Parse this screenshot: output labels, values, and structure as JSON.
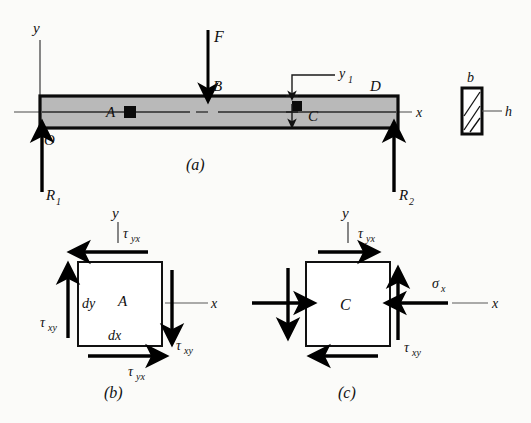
{
  "figure": {
    "panels": [
      {
        "key": "a",
        "caption": "(a)"
      },
      {
        "key": "b",
        "caption": "(b)"
      },
      {
        "key": "c",
        "caption": "(c)"
      }
    ]
  },
  "colors": {
    "beam_fill": "#b9b9b9",
    "beam_stroke": "#0b0b0b",
    "arrow": "#000000",
    "axis": "#3a3a3a",
    "background": "#fbfbf9",
    "element_fill": "#ffffff"
  },
  "panel_a": {
    "caption": "(a)",
    "axis_y_label": "y",
    "axis_x_label": "x",
    "origin_label": "O",
    "load_label": "F",
    "point_b_label": "B",
    "point_a_label": "A",
    "point_c_label": "C",
    "point_d_label": "D",
    "reaction_left_label": "R",
    "reaction_left_sub": "1",
    "reaction_right_label": "R",
    "reaction_right_sub": "2",
    "dim_y1_label": "y",
    "dim_y1_sub": "1"
  },
  "cross_section": {
    "width_label": "b",
    "height_label": "h"
  },
  "panel_b": {
    "caption": "(b)",
    "element_label": "A",
    "axis_y_label": "y",
    "axis_x_label": "x",
    "dy_label": "dy",
    "dx_label": "dx",
    "top_stress": "τ",
    "top_stress_sub": "yx",
    "bottom_stress": "τ",
    "bottom_stress_sub": "yx",
    "left_stress": "τ",
    "left_stress_sub": "xy",
    "right_stress": "τ",
    "right_stress_sub": "xy"
  },
  "panel_c": {
    "caption": "(c)",
    "element_label": "C",
    "axis_y_label": "y",
    "axis_x_label": "x",
    "top_stress": "τ",
    "top_stress_sub": "yx",
    "normal_stress": "σ",
    "normal_stress_sub": "x",
    "shear_stress": "τ",
    "shear_stress_sub": "xy"
  }
}
